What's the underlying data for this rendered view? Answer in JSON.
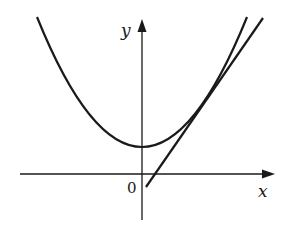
{
  "figure": {
    "type": "function-graph",
    "axes": {
      "x_label": "x",
      "y_label": "y",
      "origin_label": "0"
    },
    "curves": [
      {
        "name": "parabola",
        "kind": "quadratic",
        "vertex_on_y_axis": true
      },
      {
        "name": "tangent-line",
        "kind": "line",
        "tangent_to": "parabola"
      }
    ],
    "colors": {
      "stroke": "#1a1a1a",
      "background": "#ffffff"
    }
  }
}
